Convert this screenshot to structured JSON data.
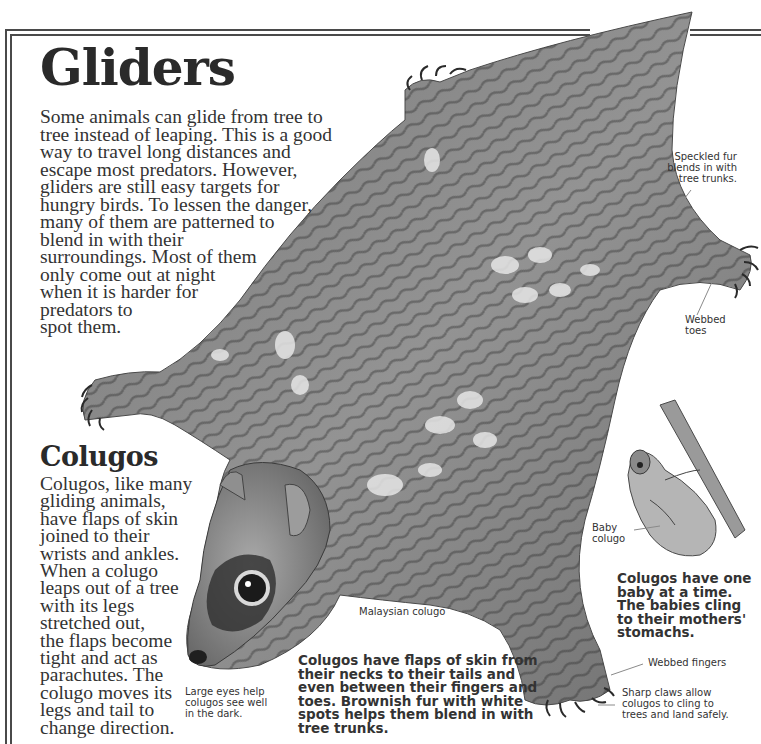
{
  "page": {
    "title": "Gliders",
    "intro_lines": [
      "Some animals can glide from tree to",
      "tree instead of leaping. This is a good",
      "way to travel long distances and",
      "escape most predators. However,",
      "gliders are still easy targets for",
      "hungry birds. To lessen the danger,",
      "many of them are patterned to",
      "blend in with their",
      "surroundings. Most of them",
      "only come out at night",
      "when it is harder for",
      "predators to",
      "spot them."
    ]
  },
  "colugos_section": {
    "heading": "Colugos",
    "body_lines": [
      "Colugos, like many",
      "gliding animals,",
      "have flaps of skin",
      "joined to their",
      "wrists and ankles.",
      "When a colugo",
      "leaps out of a tree",
      "with its legs",
      "stretched out,",
      "the flaps become",
      "tight and act as",
      "parachutes. The",
      "colugo moves its",
      "legs and tail to",
      "change direction."
    ]
  },
  "illustration": {
    "main_subject": "Malaysian colugo",
    "secondary_subject": "Mother colugo with baby on branch",
    "colors": {
      "fur_base": "#8c8c8c",
      "fur_dark": "#3a3a3a",
      "fur_light": "#e8e8e8",
      "frame": "#4a4a4a",
      "text": "#333333"
    }
  },
  "annotations": {
    "speckled_fur": [
      "Speckled fur",
      "blends in with",
      "tree trunks."
    ],
    "webbed_toes": [
      "Webbed",
      "toes"
    ],
    "baby_colugo": [
      "Baby",
      "colugo"
    ],
    "species_label": "Malaysian colugo",
    "large_eyes": [
      "Large eyes help",
      "colugos see well",
      "in the dark."
    ],
    "webbed_fingers": "Webbed fingers",
    "sharp_claws": [
      "Sharp claws allow",
      "colugos to cling to",
      "trees and land safely."
    ]
  },
  "captions": {
    "one_baby": [
      "Colugos have one",
      "baby at a time.",
      "The babies cling",
      "to their mothers'",
      "stomachs."
    ],
    "flaps": [
      "Colugos have flaps of skin from",
      "their necks to their tails and",
      "even between their fingers and",
      "toes. Brownish fur with white",
      "spots helps them blend in with",
      "tree trunks."
    ]
  }
}
